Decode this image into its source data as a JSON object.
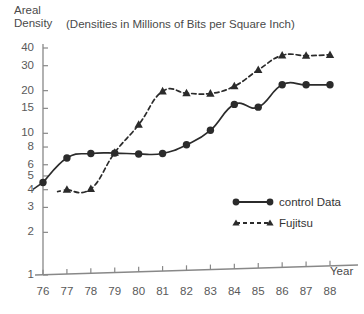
{
  "chart_data": {
    "type": "line",
    "subtitle": "(Densities in Millions of Bits per Square Inch)",
    "ylabel_line1": "Areal",
    "ylabel_line2": "Density",
    "xlabel": "Year",
    "yscale": "log",
    "ylim": [
      1,
      40
    ],
    "yticks": [
      40,
      30,
      20,
      15,
      10,
      8,
      6,
      5,
      4,
      3,
      2,
      1
    ],
    "ytick_labels": [
      "40",
      "30",
      "20",
      "15",
      "10",
      "8",
      "6",
      "5",
      "4",
      "3",
      "2",
      "1"
    ],
    "categories": [
      76,
      77,
      78,
      79,
      80,
      81,
      82,
      83,
      84,
      85,
      86,
      87,
      88
    ],
    "xtick_labels": [
      "76",
      "77",
      "78",
      "79",
      "80",
      "81",
      "82",
      "83",
      "84",
      "85",
      "86",
      "87",
      "88"
    ],
    "grid": false,
    "legend_position": "inside-right",
    "series": [
      {
        "name": "control Data",
        "marker": "circle",
        "linestyle": "solid",
        "color": "#2b2b2b",
        "x": [
          76,
          77,
          78,
          79,
          80,
          81,
          82,
          83,
          84,
          85,
          86,
          87,
          88
        ],
        "values": [
          4.5,
          6.7,
          7.2,
          7.25,
          7.15,
          7.2,
          8.3,
          10.5,
          16.0,
          15.3,
          22.0,
          22.0,
          22.0
        ]
      },
      {
        "name": "Fujitsu",
        "marker": "triangle",
        "linestyle": "dashed",
        "color": "#2b2b2b",
        "x": [
          77,
          78,
          79,
          80,
          81,
          82,
          83,
          84,
          85,
          86,
          87,
          88
        ],
        "values": [
          4.0,
          4.05,
          7.3,
          11.5,
          19.8,
          19.2,
          19.1,
          21.5,
          28.0,
          35.5,
          35.3,
          35.8
        ]
      }
    ],
    "annotations": []
  },
  "legend": {
    "items": [
      {
        "label": "control Data"
      },
      {
        "label": "Fujitsu"
      }
    ]
  }
}
